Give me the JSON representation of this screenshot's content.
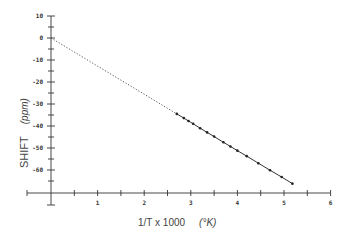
{
  "chart_data": {
    "type": "line",
    "title": "",
    "xlabel": "1/T x 1000",
    "xlabel_unit": "(°K)",
    "ylabel": "SHIFT",
    "ylabel_unit": "(ppm)",
    "xlim": [
      -0.5,
      6
    ],
    "ylim": [
      -70,
      10
    ],
    "x_ticks": [
      1,
      2,
      3,
      4,
      5,
      6
    ],
    "x_minor_ticks": [
      0.5,
      1.5,
      2.5,
      3.5,
      4.5,
      5.5
    ],
    "y_ticks": [
      10,
      0,
      -10,
      -20,
      -30,
      -40,
      -50,
      -60
    ],
    "grid": false,
    "series": [
      {
        "name": "measured",
        "style": "solid line with markers",
        "x": [
          2.7,
          2.85,
          2.95,
          3.05,
          3.2,
          3.35,
          3.5,
          3.7,
          3.85,
          4.0,
          4.2,
          4.45,
          4.7,
          4.95,
          5.18
        ],
        "y": [
          -34.5,
          -36.4,
          -37.7,
          -39.0,
          -41.0,
          -42.9,
          -44.8,
          -47.4,
          -49.3,
          -51.2,
          -53.7,
          -56.9,
          -60.1,
          -63.2,
          -66.2
        ]
      },
      {
        "name": "extrapolation",
        "style": "dotted line",
        "x": [
          0,
          2.7
        ],
        "y": [
          0,
          -34.5
        ]
      }
    ]
  }
}
